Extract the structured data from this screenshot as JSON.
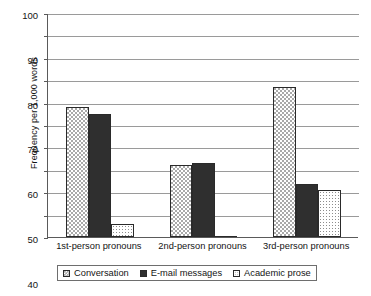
{
  "chart_data": {
    "type": "bar",
    "title": "",
    "subtitle": "",
    "xlabel": "",
    "ylabel": "Frequency per 1,000 words",
    "ylim": [
      0,
      100
    ],
    "ytick_step": 10,
    "yticks": [
      100,
      90,
      80,
      70,
      60,
      50,
      40,
      30,
      20,
      10,
      0
    ],
    "grid": true,
    "legend_position": "bottom",
    "categories": [
      "1st-person pronouns",
      "2nd-person pronouns",
      "3rd-person pronouns"
    ],
    "series": [
      {
        "name": "Conversation",
        "pattern": "checkerboard",
        "color": "#a9a9a9",
        "values": [
          58,
          32,
          67
        ]
      },
      {
        "name": "E-mail messages",
        "pattern": "solid",
        "color": "#2f2f2f",
        "values": [
          55,
          33,
          23.5
        ]
      },
      {
        "name": "Academic prose",
        "pattern": "dotted",
        "color": "#ffffff",
        "values": [
          6,
          0.3,
          21
        ]
      }
    ]
  },
  "axis": {
    "y_title": "Frequency per 1,000 words",
    "y_labels": [
      "100",
      "90",
      "80",
      "70",
      "60",
      "50",
      "40",
      "30",
      "20",
      "10",
      "0"
    ]
  },
  "legend": {
    "items": [
      {
        "label": "Conversation"
      },
      {
        "label": "E-mail messages"
      },
      {
        "label": "Academic prose"
      }
    ]
  }
}
